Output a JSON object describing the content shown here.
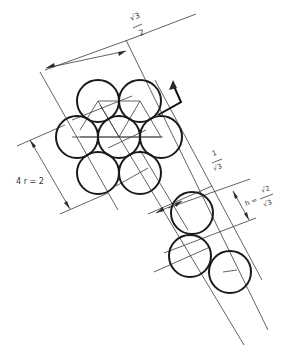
{
  "diagram": {
    "labels": {
      "top_dimension": "√3/2",
      "top_num": "√3",
      "top_den": "2",
      "left_dimension": "4 r = 2",
      "mid_dimension": "1/√3",
      "mid_num": "1",
      "mid_den": "√3",
      "right_dimension": "h = √2/√3",
      "right_prefix": "h =",
      "right_num": "√2",
      "right_den": "√3"
    },
    "cluster_circles": [
      {
        "cx": 98,
        "cy": 101,
        "r": 21
      },
      {
        "cx": 140,
        "cy": 101,
        "r": 21
      },
      {
        "cx": 77,
        "cy": 137,
        "r": 21
      },
      {
        "cx": 119,
        "cy": 137,
        "r": 21
      },
      {
        "cx": 161,
        "cy": 137,
        "r": 21
      },
      {
        "cx": 98,
        "cy": 173,
        "r": 21
      },
      {
        "cx": 140,
        "cy": 173,
        "r": 21
      }
    ],
    "chain_circles": [
      {
        "cx": 192,
        "cy": 213,
        "r": 21
      },
      {
        "cx": 190,
        "cy": 256,
        "r": 21
      },
      {
        "cx": 230,
        "cy": 272,
        "r": 21
      }
    ],
    "colors": {
      "stroke": "#1a1a1a",
      "thin": "#3a3a3a",
      "background": "#ffffff"
    }
  }
}
